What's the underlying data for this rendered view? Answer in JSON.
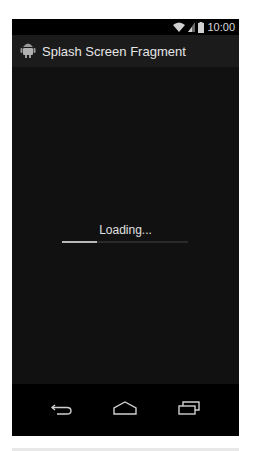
{
  "status_bar": {
    "time": "10:00",
    "icons": [
      "wifi-icon",
      "signal-icon",
      "battery-icon"
    ]
  },
  "action_bar": {
    "app_icon": "android-icon",
    "title": "Splash Screen Fragment"
  },
  "content": {
    "loading_text": "Loading...",
    "progress_percent": 28
  },
  "nav_bar": {
    "buttons": [
      {
        "name": "back",
        "icon": "back-arrow-icon"
      },
      {
        "name": "home",
        "icon": "home-icon"
      },
      {
        "name": "recents",
        "icon": "recents-icon"
      }
    ]
  },
  "colors": {
    "screen_bg": "#111111",
    "action_bar_bg": "#1b1b1b",
    "status_bar_bg": "#000000",
    "text": "#e6e6e6"
  }
}
